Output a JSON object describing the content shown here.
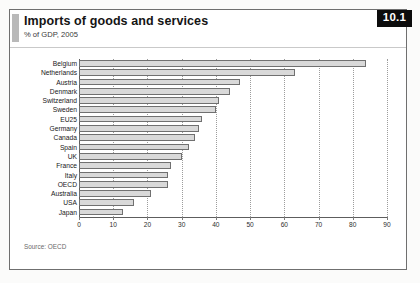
{
  "badge": "10.1",
  "header": {
    "title": "Imports of goods and services",
    "subtitle": "% of GDP, 2005"
  },
  "footer": {
    "source": "Source: OECD"
  },
  "chart_data": {
    "type": "bar",
    "orientation": "horizontal",
    "title": "Imports of goods and services",
    "subtitle": "% of GDP, 2005",
    "xlabel": "",
    "ylabel": "",
    "xlim": [
      0,
      90
    ],
    "xticks": [
      0,
      10,
      20,
      30,
      40,
      50,
      60,
      70,
      80,
      90
    ],
    "grid": true,
    "legend": false,
    "source": "Source: OECD",
    "categories": [
      "Belgium",
      "Netherlands",
      "Austria",
      "Denmark",
      "Switzerland",
      "Sweden",
      "EU25",
      "Germany",
      "Canada",
      "Spain",
      "UK",
      "France",
      "Italy",
      "OECD",
      "Australia",
      "USA",
      "Japan"
    ],
    "values": [
      84,
      63,
      47,
      44,
      41,
      40,
      36,
      35,
      34,
      32,
      30,
      27,
      26,
      26,
      21,
      16,
      13
    ],
    "series": [
      {
        "name": "% of GDP, 2005",
        "values": [
          84,
          63,
          47,
          44,
          41,
          40,
          36,
          35,
          34,
          32,
          30,
          27,
          26,
          26,
          21,
          16,
          13
        ]
      }
    ]
  }
}
